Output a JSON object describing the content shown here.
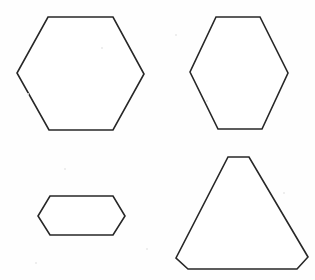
{
  "figure": {
    "background_color": "#fefefe",
    "stroke_color": "#272727",
    "fill_color": "#ffffff",
    "stroke_width": 1.6,
    "width": 315,
    "height": 280,
    "shape_count": 4,
    "shapes": [
      {
        "id": "shape-top-left",
        "name": "regular-hexagon",
        "label": "Regular hexagon, pointy-left/right orientation",
        "sides": 6,
        "position": "top-left",
        "points": "48,17 113,17 144,74 113,130 49,130 17,73",
        "bbox": [
          17,
          17,
          127,
          113
        ]
      },
      {
        "id": "shape-top-right",
        "name": "tall-hexagon",
        "label": "Tall hexagon, narrow flat top and bottom",
        "sides": 6,
        "position": "top-right",
        "points": "216,17 260,17 288,73 262,129 218,129 190,72",
        "bbox": [
          190,
          17,
          98,
          112
        ]
      },
      {
        "id": "shape-bottom-left",
        "name": "flattened-hexagon",
        "label": "Flattened wide hexagon",
        "sides": 6,
        "position": "bottom-left",
        "points": "50,196 113,196 125,216 113,235 50,235 38,216",
        "bbox": [
          38,
          196,
          87,
          39
        ]
      },
      {
        "id": "shape-bottom-right",
        "name": "truncated-triangle-hexagon",
        "label": "Hexagon shaped like a triangle with clipped corners",
        "sides": 6,
        "position": "bottom-right",
        "points": "228,157 249,157 308,257 297,269 188,269 176,258",
        "bbox": [
          176,
          157,
          132,
          112
        ]
      }
    ],
    "specks": [
      {
        "x": 27,
        "y": 93,
        "size": 2
      },
      {
        "x": 101,
        "y": 47,
        "size": 2
      },
      {
        "x": 175,
        "y": 34,
        "size": 2
      },
      {
        "x": 206,
        "y": 100,
        "size": 2
      },
      {
        "x": 283,
        "y": 192,
        "size": 2
      },
      {
        "x": 64,
        "y": 168,
        "size": 2
      },
      {
        "x": 146,
        "y": 248,
        "size": 2
      },
      {
        "x": 35,
        "y": 262,
        "size": 2
      }
    ]
  }
}
